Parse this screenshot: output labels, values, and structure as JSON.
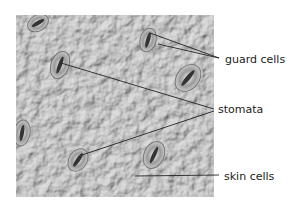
{
  "diagram": {
    "labels": [
      {
        "id": "guard_cells",
        "text": "guard cells"
      },
      {
        "id": "stomata",
        "text": "stomata"
      },
      {
        "id": "skin_cells",
        "text": "skin cells"
      }
    ]
  },
  "colors": {
    "background": "#ffffff",
    "micrograph": "#b8b8b8",
    "leader_line": "#222222"
  }
}
